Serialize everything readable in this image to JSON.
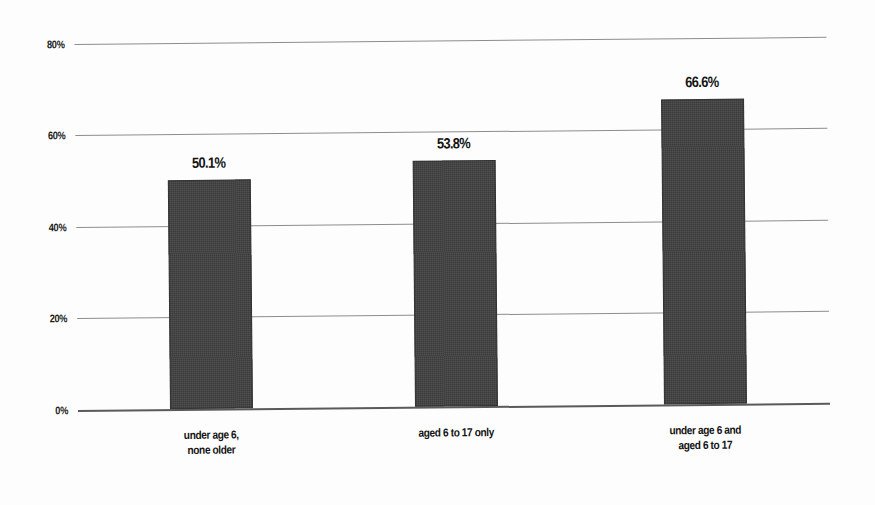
{
  "chart_data": {
    "type": "bar",
    "title": "",
    "subtitle": "",
    "xlabel": "",
    "ylabel": "",
    "categories": [
      "under age 6, none older",
      "aged 6 to 17 only",
      "under age 6 and aged 6 to 17"
    ],
    "values": [
      50.1,
      53.8,
      66.6
    ],
    "data_labels": [
      "50.1%",
      "53.8%",
      "66.6%"
    ],
    "ylim": [
      0,
      80
    ],
    "ytick_values": [
      0,
      20,
      40,
      60,
      80
    ],
    "ytick_labels": [
      "0%",
      "20%",
      "40%",
      "60%",
      "80%"
    ],
    "grid": true,
    "grid_axis": "y",
    "legend": false,
    "legend_position": "none",
    "bar_color": "#3b3b3b",
    "background_color": "#ffffff",
    "gridline_color": "#8d8d8d",
    "axis_color": "#5a5a5a",
    "label_text_color": "#141414"
  },
  "axis": {
    "y_ticks": [
      {
        "label": "80%",
        "value": 80
      },
      {
        "label": "60%",
        "value": 60
      },
      {
        "label": "40%",
        "value": 40
      },
      {
        "label": "20%",
        "value": 20
      },
      {
        "label": "0%",
        "value": 0
      }
    ]
  },
  "bars": [
    {
      "value_label": "50.1%",
      "cat_line1": "under age 6,",
      "cat_line2": "none older"
    },
    {
      "value_label": "53.8%",
      "cat_line1": "aged 6 to 17 only",
      "cat_line2": ""
    },
    {
      "value_label": "66.6%",
      "cat_line1": "under age 6 and",
      "cat_line2": "aged 6 to 17"
    }
  ]
}
